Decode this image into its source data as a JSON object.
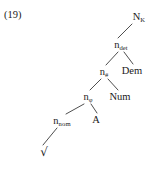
{
  "figure": {
    "example_number": "(19)",
    "type": "syntactic-tree"
  },
  "tree": {
    "nodes": [
      {
        "id": "n-k",
        "base": "N",
        "sub": "K",
        "x": 139,
        "y": 17,
        "style": "small-cap"
      },
      {
        "id": "n-det",
        "base": "n",
        "sub": "det",
        "x": 121,
        "y": 45,
        "style": "plain"
      },
      {
        "id": "n-num",
        "base": "n",
        "sub": "#",
        "x": 104,
        "y": 72,
        "style": "plain"
      },
      {
        "id": "dem",
        "base": "Dem",
        "sub": "",
        "x": 132,
        "y": 71,
        "style": "plain"
      },
      {
        "id": "n-phi",
        "base": "n",
        "sub": "φ",
        "x": 88,
        "y": 97,
        "style": "plain"
      },
      {
        "id": "num",
        "base": "Num",
        "sub": "",
        "x": 120,
        "y": 97,
        "style": "plain"
      },
      {
        "id": "n-nom",
        "base": "n",
        "sub": "nom",
        "x": 62,
        "y": 121,
        "style": "plain"
      },
      {
        "id": "a",
        "base": "A",
        "sub": "",
        "x": 96,
        "y": 120,
        "style": "plain"
      },
      {
        "id": "root",
        "base": "√",
        "sub": "",
        "x": 44,
        "y": 152,
        "style": "radical"
      }
    ],
    "edges": [
      {
        "id": "edge-nk-ndet",
        "from": "n-k",
        "to": "n-det",
        "x1": 132,
        "y1": 24,
        "x2": 118,
        "y2": 38
      },
      {
        "id": "edge-ndet-nnum",
        "from": "n-det",
        "to": "n-num",
        "x1": 118,
        "y1": 52,
        "x2": 106,
        "y2": 65
      },
      {
        "id": "edge-ndet-dem",
        "from": "n-det",
        "to": "dem",
        "x1": 124,
        "y1": 52,
        "x2": 133,
        "y2": 64
      },
      {
        "id": "edge-nnum-nphi",
        "from": "n-num",
        "to": "n-phi",
        "x1": 101,
        "y1": 79,
        "x2": 90,
        "y2": 90
      },
      {
        "id": "edge-nnum-num",
        "from": "n-num",
        "to": "num",
        "x1": 108,
        "y1": 79,
        "x2": 118,
        "y2": 90
      },
      {
        "id": "edge-nphi-nnom",
        "from": "n-phi",
        "to": "n-nom",
        "x1": 84,
        "y1": 104,
        "x2": 66,
        "y2": 114
      },
      {
        "id": "edge-nphi-a",
        "from": "n-phi",
        "to": "a",
        "x1": 91,
        "y1": 104,
        "x2": 97,
        "y2": 113
      },
      {
        "id": "edge-nnom-root",
        "from": "n-nom",
        "to": "root",
        "x1": 57,
        "y1": 128,
        "x2": 43,
        "y2": 145
      }
    ]
  }
}
